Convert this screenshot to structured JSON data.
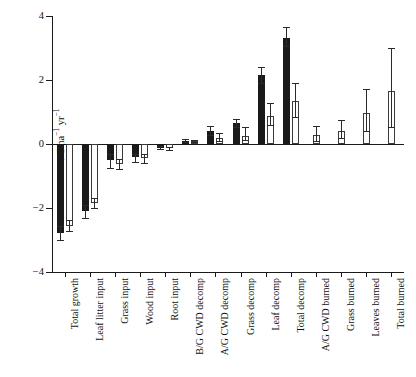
{
  "chart_data": {
    "type": "bar",
    "title": "",
    "xlabel": "",
    "ylabel": "t C ha-1 yr-1",
    "ylabel_parts": {
      "prefix": "t C ha",
      "sup1": "−1",
      "mid": " yr",
      "sup2": "−1"
    },
    "ylim": [
      -4,
      4
    ],
    "yticks": [
      4,
      2,
      0,
      -2,
      -4
    ],
    "ytick_labels": [
      "4",
      "2",
      "0",
      "−2",
      "−4"
    ],
    "grid": false,
    "legend": "none",
    "zero_line": 0,
    "categories": [
      "Total growth",
      "Leaf litter input",
      "Grass input",
      "Wood input",
      "Root input",
      "B/G CWD decomp",
      "A/G CWD decomp",
      "Grass decomp",
      "Leaf decomp",
      "Total decomp",
      "A/G CWD burned",
      "Grass burned",
      "Leaves burned",
      "Total burned"
    ],
    "series": [
      {
        "name": "black",
        "fill": "#1a1a1a",
        "values": [
          -2.78,
          -2.1,
          -0.5,
          -0.42,
          -0.12,
          0.1,
          0.42,
          0.65,
          2.15,
          3.3,
          null,
          null,
          null,
          null
        ],
        "err_low": [
          -3.0,
          -2.32,
          -0.74,
          -0.57,
          -0.17,
          0.06,
          0.27,
          0.52,
          1.92,
          3.05,
          null,
          null,
          null,
          null
        ],
        "err_high": [
          -2.56,
          -1.9,
          -0.32,
          -0.3,
          -0.07,
          0.15,
          0.57,
          0.78,
          2.4,
          3.65,
          null,
          null,
          null,
          null
        ]
      },
      {
        "name": "white",
        "fill": "#ffffff",
        "values": [
          -2.55,
          -1.85,
          -0.62,
          -0.45,
          -0.13,
          0.09,
          0.2,
          0.25,
          0.88,
          1.35,
          0.28,
          0.42,
          0.97,
          1.65
        ],
        "err_low": [
          -2.72,
          -2.0,
          -0.78,
          -0.58,
          -0.18,
          0.05,
          0.1,
          0.12,
          0.6,
          0.85,
          0.08,
          0.2,
          0.4,
          0.52
        ],
        "err_high": [
          -2.38,
          -1.7,
          -0.46,
          -0.32,
          -0.08,
          0.13,
          0.33,
          0.53,
          1.27,
          1.92,
          0.57,
          0.75,
          1.72,
          3.0
        ]
      }
    ]
  }
}
